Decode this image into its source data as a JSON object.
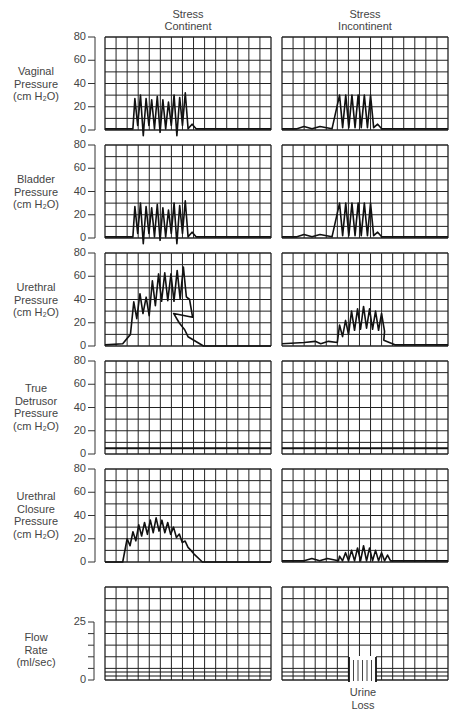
{
  "columns": [
    {
      "label": "Stress\nContinent"
    },
    {
      "label": "Stress\nIncontinent"
    }
  ],
  "rows": [
    {
      "label": "Vaginal\nPressure\n(cm H₂O)",
      "yticks": [
        "80",
        "60",
        "40",
        "20",
        "0"
      ]
    },
    {
      "label": "Bladder\nPressure\n(cm H₂O)",
      "yticks": [
        "80",
        "60",
        "40",
        "20",
        "0"
      ]
    },
    {
      "label": "Urethral\nPressure\n(cm H₂O)",
      "yticks": [
        "80",
        "60",
        "40",
        "20",
        "0"
      ]
    },
    {
      "label": "True\nDetrusor\nPressure\n(cm H₂O)",
      "yticks": [
        "80",
        "60",
        "40",
        "20",
        "0"
      ]
    },
    {
      "label": "Urethral\nClosure\nPressure\n(cm H₂O)",
      "yticks": [
        "80",
        "60",
        "40",
        "20",
        "0"
      ]
    },
    {
      "label": "Flow\nRate\n(ml/sec)",
      "yticks": [
        "25",
        "0"
      ]
    }
  ],
  "annotation": {
    "urine_loss": "Urine\nLoss"
  },
  "colors": {
    "grid": "#222222",
    "trace": "#111111",
    "text": "#444444"
  },
  "chart_data": {
    "type": "line",
    "title": "",
    "layout": "grid of small multiples: 6 rows x 2 columns, each panel 15 x 8 gridlines",
    "column_titles": [
      "Stress Continent",
      "Stress Incontinent"
    ],
    "xlabel": "",
    "panels": [
      {
        "row": "Vaginal Pressure (cm H2O)",
        "ylim": [
          0,
          80
        ],
        "yticks": [
          0,
          20,
          40,
          60,
          80
        ],
        "series": [
          {
            "name": "Stress Continent",
            "description": "baseline ~1, then 10 cough spikes peaking ~25-32 between grid columns 3 and 8, return to ~1",
            "peaks": [
              27,
              30,
              27,
              26,
              29,
              26,
              24,
              30,
              28,
              32
            ]
          },
          {
            "name": "Stress Incontinent",
            "description": "low undulations ~2-3 then 6 cough spikes peaking ~30 between grid columns 5 and 9, return to ~1",
            "peaks": [
              30,
              30,
              30,
              30,
              30,
              30
            ]
          }
        ]
      },
      {
        "row": "Bladder Pressure (cm H2O)",
        "ylim": [
          0,
          80
        ],
        "yticks": [
          0,
          20,
          40,
          60,
          80
        ],
        "series": [
          {
            "name": "Stress Continent",
            "peaks": [
              27,
              30,
              27,
              26,
              29,
              26,
              24,
              30,
              28,
              32
            ]
          },
          {
            "name": "Stress Incontinent",
            "peaks": [
              30,
              30,
              30,
              30,
              30,
              30
            ]
          }
        ]
      },
      {
        "row": "Urethral Pressure (cm H2O)",
        "ylim": [
          0,
          80
        ],
        "yticks": [
          0,
          20,
          40,
          60,
          80
        ],
        "series": [
          {
            "name": "Stress Continent",
            "description": "rises from baseline ~1 to a dome with spikes peaking ~38-68, returns to 0 by column 9",
            "peaks": [
              38,
              45,
              42,
              56,
              62,
              63,
              62,
              65,
              68,
              40
            ]
          },
          {
            "name": "Stress Incontinent",
            "description": "baseline ~2-4 then spikes peaking ~20-34 between columns 5 and 9",
            "peaks": [
              18,
              22,
              30,
              32,
              34,
              32,
              30,
              28
            ]
          }
        ]
      },
      {
        "row": "True Detrusor Pressure (cm H2O)",
        "ylim": [
          0,
          80
        ],
        "yticks": [
          0,
          20,
          40,
          60,
          80
        ],
        "series": [
          {
            "name": "Stress Continent",
            "description": "flat line at ~5",
            "value": 5
          },
          {
            "name": "Stress Incontinent",
            "description": "flat line at ~5",
            "value": 5
          }
        ]
      },
      {
        "row": "Urethral Closure Pressure (cm H2O)",
        "ylim": [
          0,
          80
        ],
        "yticks": [
          0,
          20,
          40,
          60,
          80
        ],
        "series": [
          {
            "name": "Stress Continent",
            "description": "dome of spikes peaking ~20-38, centered at column 5",
            "peaks": [
              20,
              26,
              32,
              34,
              36,
              38,
              36,
              34,
              30,
              24,
              18,
              10
            ]
          },
          {
            "name": "Stress Incontinent",
            "description": "low undulations then small spikes peaking ~6-14",
            "peaks": [
              5,
              8,
              10,
              12,
              14,
              12,
              10,
              8,
              6
            ]
          }
        ]
      },
      {
        "row": "Flow Rate (ml/sec)",
        "ylim": [
          0,
          25
        ],
        "yticks": [
          0,
          25
        ],
        "series": [
          {
            "name": "Stress Continent",
            "description": "no flow, baseline ~0"
          },
          {
            "name": "Stress Incontinent",
            "description": "no flow except a hatched 'Urine Loss' block between grid columns ~5 and ~6"
          }
        ]
      }
    ],
    "annotations": [
      "Urine Loss"
    ],
    "grid": true
  }
}
